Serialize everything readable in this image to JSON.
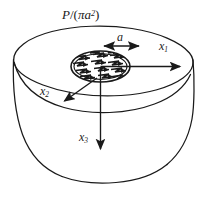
{
  "figure": {
    "name": "circular-load-on-elastic-half-space",
    "background_color": "#ffffff",
    "line_color": "#1a1a1a",
    "labels": {
      "load_pressure_numerator": "P",
      "load_pressure_slash": "/(",
      "load_pressure_pi": "π",
      "load_pressure_a": "a",
      "load_pressure_exponent": "2",
      "load_pressure_close": ")",
      "radius": "a",
      "axis_1": "x",
      "axis_1_sub": "1",
      "axis_2": "x",
      "axis_2_sub": "2",
      "axis_3": "x",
      "axis_3_sub": "3"
    },
    "elements": {
      "top_surface": "top-elliptical-surface",
      "body": "solid-body-outline",
      "loaded_area": "hatched-circular-loaded-area",
      "radius_dimension": "radius-double-arrow",
      "axis_1_arrow": "x1-axis-arrow",
      "axis_2_arrow": "x2-axis-arrow",
      "axis_3_arrow": "x3-axis-arrow"
    }
  }
}
